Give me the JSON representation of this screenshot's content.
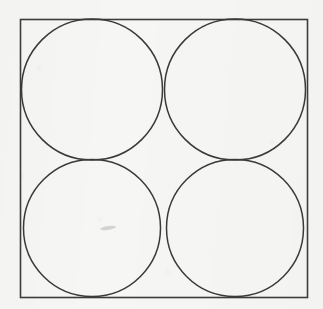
{
  "figure": {
    "title": "Four congruent circles inscribed in a square",
    "description": "A square outline containing four equal circles arranged in a 2 by 2 grid; each circle is tangent to two sides of the square and to its two neighbouring circles.",
    "medium": "scanned line drawing",
    "background_color": "#f6f6f4",
    "ink_color": "#3a3a3a",
    "square": {
      "label": "outer square",
      "x": 20.5,
      "y": 19.5,
      "width": 287,
      "height": 278,
      "stroke_color": "#3d3d3d",
      "stroke_width": 1.6,
      "fill": "none"
    },
    "circles": [
      {
        "label": "top-left circle",
        "cx": 92,
        "cy": 89.5,
        "r": 70.5,
        "stroke_color": "#3a3a3a",
        "stroke_width": 1.5,
        "fill": "none"
      },
      {
        "label": "top-right circle",
        "cx": 235,
        "cy": 89.5,
        "r": 70.5,
        "stroke_color": "#3a3a3a",
        "stroke_width": 1.5,
        "fill": "none"
      },
      {
        "label": "bottom-left circle",
        "cx": 92,
        "cy": 228,
        "r": 68.5,
        "stroke_color": "#3a3a3a",
        "stroke_width": 1.5,
        "fill": "none"
      },
      {
        "label": "bottom-right circle",
        "cx": 235,
        "cy": 228,
        "r": 68.5,
        "stroke_color": "#3a3a3a",
        "stroke_width": 1.5,
        "fill": "none"
      }
    ],
    "tangent_points": [
      {
        "label": "top pair tangency",
        "x": 163.5,
        "y": 89.5
      },
      {
        "label": "bottom pair tangency",
        "x": 163.5,
        "y": 228
      },
      {
        "label": "left pair tangency",
        "x": 92,
        "y": 160
      },
      {
        "label": "right pair tangency",
        "x": 235,
        "y": 160
      }
    ],
    "artifacts": [
      {
        "label": "scan smudge",
        "x": 100,
        "y": 226,
        "width": 16,
        "height": 4,
        "opacity": 0.18,
        "rotation": -8
      }
    ]
  }
}
